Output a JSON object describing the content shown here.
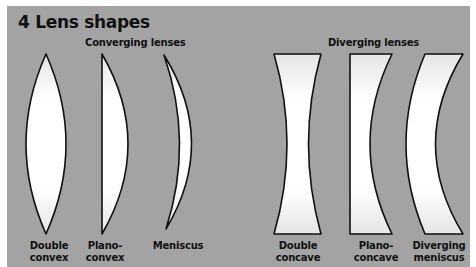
{
  "title": "4 Lens shapes",
  "colors": {
    "background": "#a3a3a3",
    "lens_fill": "#ffffff",
    "lens_stroke": "#111111"
  },
  "groups": {
    "converging": {
      "label": "Converging lenses",
      "lenses": [
        {
          "name": "double-convex",
          "label_line1": "Double",
          "label_line2": "convex"
        },
        {
          "name": "plano-convex",
          "label_line1": "Plano-",
          "label_line2": "convex"
        },
        {
          "name": "meniscus",
          "label_line1": "Meniscus",
          "label_line2": ""
        }
      ]
    },
    "diverging": {
      "label": "Diverging lenses",
      "lenses": [
        {
          "name": "double-concave",
          "label_line1": "Double",
          "label_line2": "concave"
        },
        {
          "name": "plano-concave",
          "label_line1": "Plano-",
          "label_line2": "concave"
        },
        {
          "name": "diverging-meniscus",
          "label_line1": "Diverging",
          "label_line2": "meniscus"
        }
      ]
    }
  }
}
